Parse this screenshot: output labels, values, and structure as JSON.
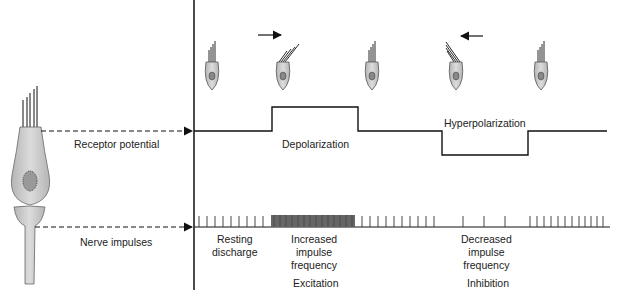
{
  "left_labels": {
    "receptor_potential": "Receptor potential",
    "nerve_impulses": "Nerve impulses"
  },
  "potential_labels": {
    "depolarization": "Depolarization",
    "hyperpolarization": "Hyperpolarization"
  },
  "impulse_labels": {
    "resting": [
      "Resting",
      "discharge"
    ],
    "increased": [
      "Increased",
      "impulse",
      "frequency"
    ],
    "decreased": [
      "Decreased",
      "impulse",
      "frequency"
    ]
  },
  "response_labels": {
    "excitation": "Excitation",
    "inhibition": "Inhibition"
  },
  "colors": {
    "cell_fill": "#c8c8c8",
    "line": "#111111"
  }
}
